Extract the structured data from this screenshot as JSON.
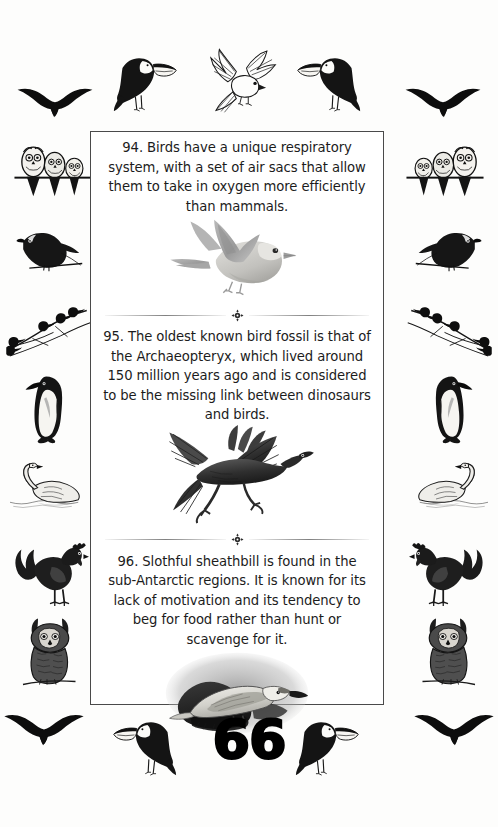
{
  "document": {
    "title": "Bird Facts",
    "page_number": "66",
    "ink_color": "#1a1a1a",
    "paper_color": "#fdfdfc",
    "box_border_color": "#4a4a4a"
  },
  "facts": [
    {
      "id": "fact-94",
      "number": "94.",
      "text": "94. Birds have a unique respiratory system, with a set of air sacs that allow them to take in oxygen more efficiently than mammals.",
      "illustration": "flying-songbird-illustration",
      "illustration_caption": "Pale grey songbird in flight with wings raised"
    },
    {
      "id": "fact-95",
      "number": "95.",
      "text": "95. The oldest known bird fossil is that of the Archaeopteryx, which lived around 150 million years ago and is considered to be the missing link between dinosaurs and birds.",
      "illustration": "archaeopteryx-illustration",
      "illustration_caption": "Dark Archaeopteryx running with outstretched feathered wings"
    },
    {
      "id": "fact-96",
      "number": "96.",
      "text": "96. Slothful sheathbill is found in the sub-Antarctic regions. It is known for its lack of motivation and its tendency to beg for food rather than hunt or scavenge for it.",
      "illustration": "sheathbill-illustration",
      "illustration_caption": "Engraved sheathbill perched on dark rocks"
    }
  ],
  "dividers": {
    "ornament": "cross-fleuron-ornament",
    "count": 2
  },
  "border_decorations": {
    "top": [
      {
        "name": "toucan-perched-left",
        "position": "top-left"
      },
      {
        "name": "landing-bird-center",
        "position": "top-center"
      },
      {
        "name": "toucan-perched-right",
        "position": "top-right"
      }
    ],
    "left_column": [
      {
        "name": "flying-gull",
        "position": "left-1"
      },
      {
        "name": "three-owls-on-branch",
        "position": "left-2"
      },
      {
        "name": "perched-parrot",
        "position": "left-3"
      },
      {
        "name": "birds-on-bare-branch",
        "position": "left-4"
      },
      {
        "name": "king-penguin",
        "position": "left-5"
      },
      {
        "name": "swimming-swan",
        "position": "left-6"
      },
      {
        "name": "standing-rooster",
        "position": "left-7"
      },
      {
        "name": "great-horned-owl",
        "position": "left-8"
      },
      {
        "name": "flying-gull-lower",
        "position": "left-9"
      }
    ],
    "right_column": [
      {
        "name": "flying-gull",
        "position": "right-1"
      },
      {
        "name": "three-owls-on-branch",
        "position": "right-2"
      },
      {
        "name": "perched-parrot",
        "position": "right-3"
      },
      {
        "name": "birds-on-bare-branch",
        "position": "right-4"
      },
      {
        "name": "king-penguin",
        "position": "right-5"
      },
      {
        "name": "swimming-swan",
        "position": "right-6"
      },
      {
        "name": "standing-rooster",
        "position": "right-7"
      },
      {
        "name": "great-horned-owl",
        "position": "right-8"
      },
      {
        "name": "flying-gull-lower",
        "position": "right-9"
      }
    ],
    "bottom": [
      {
        "name": "toucan-facing-right",
        "position": "bottom-left-of-number"
      },
      {
        "name": "toucan-facing-left",
        "position": "bottom-right-of-number"
      },
      {
        "name": "flying-gull",
        "position": "bottom-far-left"
      },
      {
        "name": "flying-gull",
        "position": "bottom-far-right"
      }
    ]
  }
}
